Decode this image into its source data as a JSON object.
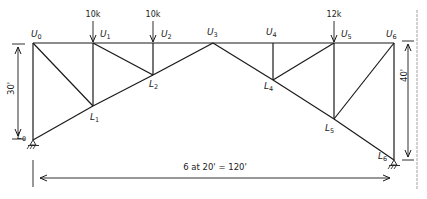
{
  "diagram": {
    "type": "truss",
    "nodes": {
      "U0": {
        "label": "U",
        "sub": "0"
      },
      "U1": {
        "label": "U",
        "sub": "1"
      },
      "U2": {
        "label": "U",
        "sub": "2"
      },
      "U3": {
        "label": "U",
        "sub": "3"
      },
      "U4": {
        "label": "U",
        "sub": "4"
      },
      "U5": {
        "label": "U",
        "sub": "5"
      },
      "U6": {
        "label": "U",
        "sub": "6"
      },
      "L0": {
        "label": "L",
        "sub": "0"
      },
      "L1": {
        "label": "L",
        "sub": "1"
      },
      "L2": {
        "label": "L",
        "sub": "2"
      },
      "L4": {
        "label": "L",
        "sub": "4"
      },
      "L5": {
        "label": "L",
        "sub": "5"
      },
      "L6": {
        "label": "L",
        "sub": "6"
      }
    },
    "members": [
      [
        "U0",
        "U1"
      ],
      [
        "U1",
        "U2"
      ],
      [
        "U2",
        "U3"
      ],
      [
        "U3",
        "U4"
      ],
      [
        "U4",
        "U5"
      ],
      [
        "U5",
        "U6"
      ],
      [
        "U0",
        "L0"
      ],
      [
        "U1",
        "L1"
      ],
      [
        "U2",
        "L2"
      ],
      [
        "U4",
        "L4"
      ],
      [
        "U5",
        "L5"
      ],
      [
        "U6",
        "L6"
      ],
      [
        "L0",
        "L1"
      ],
      [
        "L1",
        "L2"
      ],
      [
        "L2",
        "U3"
      ],
      [
        "U3",
        "L4"
      ],
      [
        "L4",
        "L5"
      ],
      [
        "L5",
        "L6"
      ],
      [
        "U0",
        "L1"
      ],
      [
        "U1",
        "L2"
      ],
      [
        "L4",
        "U5"
      ],
      [
        "L5",
        "U6"
      ]
    ],
    "loads": [
      {
        "node": "U1",
        "label": "10k"
      },
      {
        "node": "U2",
        "label": "10k"
      },
      {
        "node": "U5",
        "label": "12k"
      }
    ],
    "supports": [
      {
        "node": "L0",
        "type": "pin"
      },
      {
        "node": "L6",
        "type": "pin"
      }
    ],
    "dimensions": {
      "left_height": "30'",
      "right_height": "40'",
      "span": "6 at 20' = 120'"
    }
  }
}
